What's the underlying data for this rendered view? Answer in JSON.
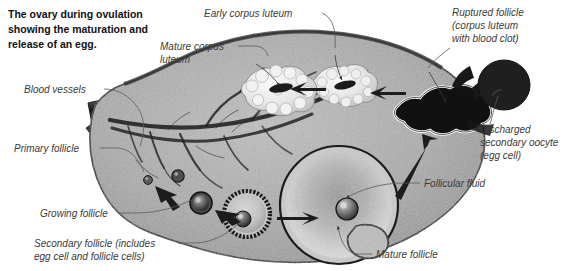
{
  "figure": {
    "title_lines": [
      "The ovary during ovulation",
      "showing the maturation and",
      "release of an egg."
    ],
    "background_color": "#ffffff",
    "body_fill": "#a8a8a8",
    "outline_color": "#1a1a1a",
    "label_color": "#3a3a3a",
    "title_color": "#111111"
  },
  "labels": {
    "blood_vessels": "Blood vessels",
    "mature_corpus_luteum_line1": "Mature corpus",
    "mature_corpus_luteum_line2": "luteum",
    "early_corpus_luteum": "Early corpus luteum",
    "ruptured_follicle_line1": "Ruptured follicle",
    "ruptured_follicle_line2": "(corpus luteum",
    "ruptured_follicle_line3": "with blood clot)",
    "discharged_oocyte_line1": "Discharged",
    "discharged_oocyte_line2": "secondary oocyte",
    "discharged_oocyte_line3": "(egg cell)",
    "primary_follicle": "Primary follicle",
    "growing_follicle": "Growing follicle",
    "secondary_follicle_line1": "Secondary follicle (includes",
    "secondary_follicle_line2": "egg cell and follicle cells)",
    "follicular_fluid": "Follicular fluid",
    "mature_follicle": "Mature follicle"
  },
  "structures": {
    "ovary_body": "ovary-cross-section",
    "vessel_network": "blood-vessel-network",
    "corpus_luteum_mature": "mature-corpus-luteum",
    "corpus_luteum_early": "early-corpus-luteum",
    "ruptured_follicle": "ruptured-follicle-blood-clot",
    "discharged_oocyte": "discharged-secondary-oocyte",
    "primary_follicle": "primary-follicle",
    "growing_follicle": "growing-follicle",
    "secondary_follicle": "secondary-follicle",
    "mature_follicle": "mature-follicle",
    "follicular_fluid": "follicular-fluid"
  }
}
